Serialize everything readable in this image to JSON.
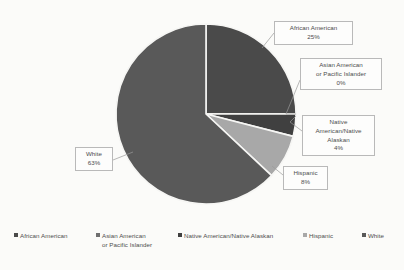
{
  "chart_data": {
    "type": "pie",
    "title": "",
    "categories": [
      "African American",
      "Asian American or Pacific Islander",
      "Native American/Native Alaskan",
      "Hispanic",
      "White"
    ],
    "values": [
      25,
      0,
      4,
      8,
      63
    ],
    "value_labels": [
      "25%",
      "0%",
      "4%",
      "8%",
      "63%"
    ],
    "units": "percent",
    "legend_position": "bottom",
    "grid": false,
    "start_angle_deg": 0,
    "colors": [
      "#4a4a4a",
      "#6f6f6f",
      "#404040",
      "#a8a8a8",
      "#595959"
    ],
    "slices": [
      {
        "name": "African American",
        "value": 25,
        "label": "25%",
        "color": "#4a4a4a"
      },
      {
        "name": "Asian American or Pacific Islander",
        "value": 0,
        "label": "0%",
        "color": "#6f6f6f"
      },
      {
        "name": "Native American/Native Alaskan",
        "value": 4,
        "label": "4%",
        "color": "#404040"
      },
      {
        "name": "Hispanic",
        "value": 8,
        "label": "8%",
        "color": "#a8a8a8"
      },
      {
        "name": "White",
        "value": 63,
        "label": "63%",
        "color": "#595959"
      }
    ]
  },
  "callouts": {
    "african_american": {
      "line1": "African American",
      "line2": "25%"
    },
    "asian_american": {
      "line1": "Asian American",
      "line2": "or Pacific Islander",
      "line3": "0%"
    },
    "native_american": {
      "line1": "Native",
      "line2": "American/Native",
      "line3": "Alaskan",
      "line4": "4%"
    },
    "hispanic": {
      "line1": "Hispanic",
      "line2": "8%"
    },
    "white": {
      "line1": "White",
      "line2": "63%"
    }
  },
  "legend": {
    "items": [
      {
        "label": "African American",
        "label2": "",
        "color": "#4a4a4a"
      },
      {
        "label": "Asian American",
        "label2": "or Pacific Islander",
        "color": "#6f6f6f"
      },
      {
        "label": "Native American/Native Alaskan",
        "label2": "",
        "color": "#404040"
      },
      {
        "label": "Hispanic",
        "label2": "",
        "color": "#a8a8a8"
      },
      {
        "label": "White",
        "label2": "",
        "color": "#595959"
      }
    ]
  }
}
